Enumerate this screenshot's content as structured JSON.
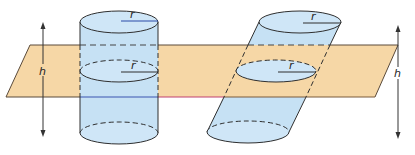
{
  "figure": {
    "colors": {
      "plane_fill": "#F6D7A6",
      "plane_stroke": "#5a4a3a",
      "cylinder_fill": "#C6E1F4",
      "cylinder_top_fill": "#CFE6F7",
      "stroke": "#2f2f2f",
      "radius_line": "#2a4aa8",
      "arrow": "#333333"
    },
    "left_cylinder": {
      "type": "right cylinder",
      "radius_label_top": "r",
      "radius_label_mid": "r"
    },
    "right_cylinder": {
      "type": "oblique cylinder",
      "radius_label_top": "r",
      "radius_label_mid": "r"
    },
    "left_height_label": "h",
    "right_height_label": "h"
  }
}
